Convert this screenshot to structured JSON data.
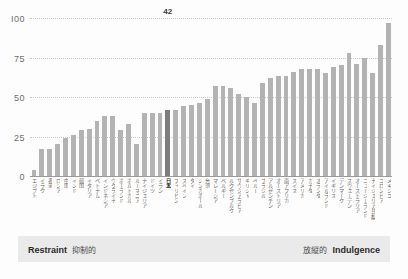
{
  "footer": {
    "left_en": "Restraint",
    "left_ja": "抑制的",
    "right_ja": "放縦的",
    "right_en": "Indulgence"
  },
  "colors": {
    "bar": "#b3b3b3",
    "bar_highlight": "#7d7d7d",
    "grid": "#c9c9c9",
    "axis": "#9a9a9a",
    "footer_bg": "#eaeaea"
  },
  "chart_data": {
    "type": "bar",
    "title": "",
    "xlabel": "",
    "ylabel": "",
    "ylim": [
      0,
      100
    ],
    "yticks": [
      0,
      25,
      50,
      75,
      100
    ],
    "ytick_labels": [
      "0",
      "25",
      "50",
      "75",
      "I00"
    ],
    "grid": true,
    "legend": "none",
    "highlight_category": "日本",
    "highlight_value": 42,
    "value_labels": {
      "日本": "42"
    },
    "categories": [
      "エジプト",
      "イラク",
      "香港",
      "ロシア",
      "中国",
      "インド",
      "韓国",
      "イタリア",
      "ベトナム",
      "インドネシア",
      "ウクライナ",
      "ポーランド",
      "ポルトガル",
      "ルーマニア",
      "ナイジェリア",
      "ドイツ",
      "イラン",
      "日本",
      "フィリピン",
      "スペイン",
      "タイ",
      "シンガポール",
      "台湾",
      "マレーシア",
      "ベルギー",
      "ルクセンブルク",
      "サウジアラビア",
      "ギリシャ",
      "ペルー",
      "ブラジル",
      "アルゼンチン",
      "オーストリア",
      "南アフリカ",
      "スイス",
      "アメリカ",
      "カナダ",
      "オランダ",
      "アイルランド",
      "イギリス",
      "デンマーク",
      "スウェーデン",
      "オーストラリア",
      "ニュージーランド",
      "ナイジェリア共和国",
      "コロンビア",
      "メキシコ"
    ],
    "values": [
      4,
      17,
      17,
      20,
      24,
      26,
      29,
      30,
      35,
      38,
      38,
      29,
      33,
      20,
      40,
      40,
      40,
      42,
      42,
      44,
      45,
      46,
      49,
      57,
      57,
      56,
      52,
      50,
      46,
      59,
      62,
      63,
      63,
      66,
      68,
      68,
      68,
      65,
      69,
      70,
      78,
      71,
      75,
      65,
      83,
      97
    ]
  }
}
